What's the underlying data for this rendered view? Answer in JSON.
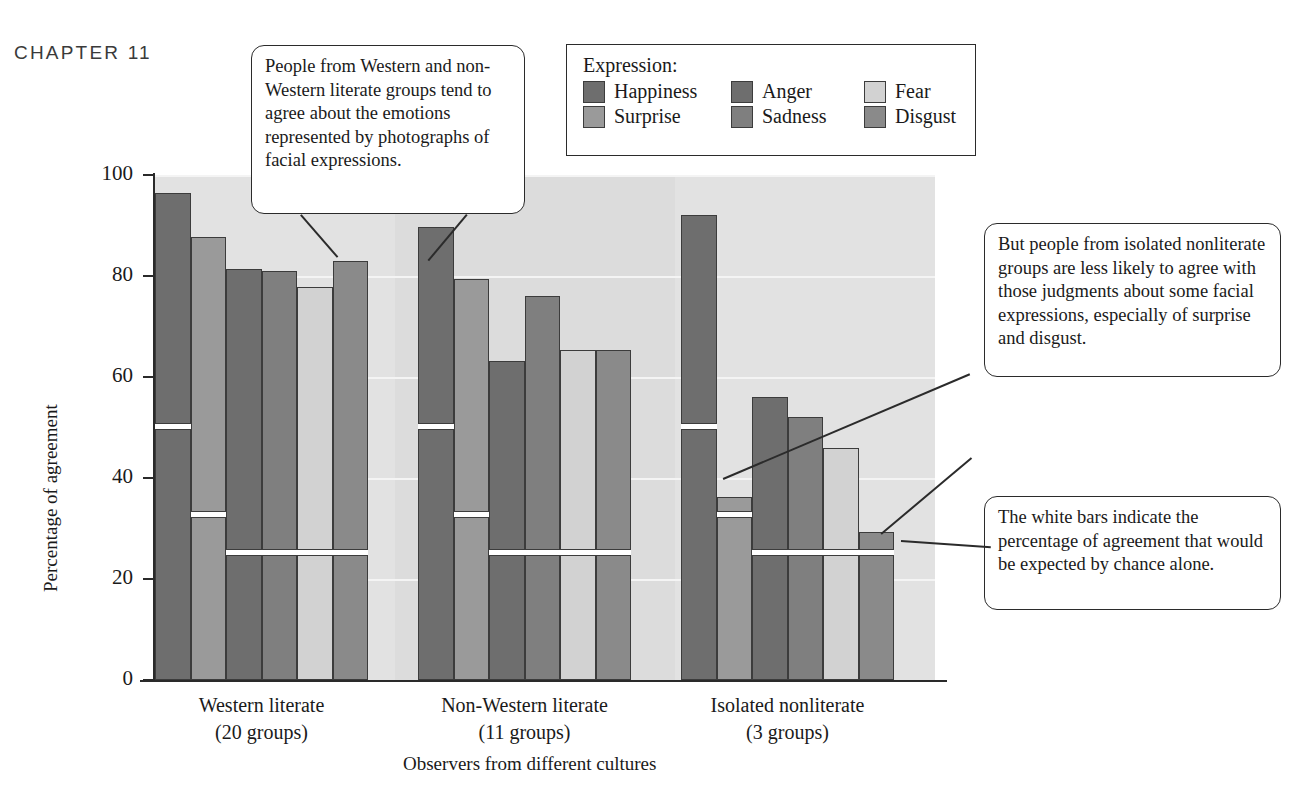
{
  "header": {
    "chapter": "CHAPTER 11"
  },
  "legend": {
    "title": "Expression:",
    "items": [
      {
        "label": "Happiness",
        "color": "#6e6e6e"
      },
      {
        "label": "Anger",
        "color": "#6e6e6e"
      },
      {
        "label": "Fear",
        "color": "#d2d2d2"
      },
      {
        "label": "Surprise",
        "color": "#9a9a9a"
      },
      {
        "label": "Sadness",
        "color": "#7f7f7f"
      },
      {
        "label": "Disgust",
        "color": "#8a8a8a"
      }
    ]
  },
  "callouts": [
    {
      "id": "callout-literate-agreement",
      "text": "People from Western and non-Western literate groups tend to agree about the emotions represented by photographs of facial expressions."
    },
    {
      "id": "callout-nonliterate-disagreement",
      "text": "But people from isolated nonliterate groups are less likely to agree with those judgments about some facial expressions, especially of surprise and disgust."
    },
    {
      "id": "callout-white-bars-chance",
      "text": "The white bars indicate the percentage of agreement that would be expected by chance alone."
    }
  ],
  "chart_data": {
    "type": "bar",
    "title": "",
    "xlabel": "Observers from different cultures",
    "ylabel": "Percentage of agreement",
    "ylim": [
      0,
      100
    ],
    "yticks": [
      0,
      20,
      40,
      60,
      80,
      100
    ],
    "grid": true,
    "legend_position": "top-right",
    "categories": [
      "Western literate\n(20 groups)",
      "Non-Western literate\n(11 groups)",
      "Isolated nonliterate\n(3 groups)"
    ],
    "group_labels": [
      {
        "line1": "Western literate",
        "line2": "(20 groups)"
      },
      {
        "line1": "Non-Western literate",
        "line2": "(11 groups)"
      },
      {
        "line1": "Isolated nonliterate",
        "line2": "(3 groups)"
      }
    ],
    "series": [
      {
        "name": "Happiness",
        "color": "#6e6e6e",
        "values": [
          96.5,
          89.8,
          92.0
        ],
        "chance": [
          50,
          50,
          50
        ]
      },
      {
        "name": "Surprise",
        "color": "#9a9a9a",
        "values": [
          87.8,
          79.4,
          36.3
        ],
        "chance": [
          32.5,
          32.5,
          32.5
        ]
      },
      {
        "name": "Anger",
        "color": "#6e6e6e",
        "values": [
          81.4,
          63.1,
          56.0
        ],
        "chance": [
          25,
          25,
          25
        ]
      },
      {
        "name": "Sadness",
        "color": "#7f7f7f",
        "values": [
          81.0,
          76.0,
          52.0
        ],
        "chance": [
          25,
          25,
          25
        ]
      },
      {
        "name": "Fear",
        "color": "#d2d2d2",
        "values": [
          77.8,
          65.4,
          45.9
        ],
        "chance": [
          25,
          25,
          25
        ]
      },
      {
        "name": "Disgust",
        "color": "#8a8a8a",
        "values": [
          82.9,
          65.3,
          29.3
        ],
        "chance": [
          25,
          25,
          25
        ]
      }
    ],
    "chance_note": "White bars indicate percentage of agreement expected by chance alone"
  }
}
